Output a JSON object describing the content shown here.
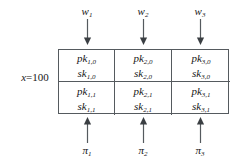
{
  "figure": {
    "type": "diagram",
    "background_color": "#ffffff",
    "line_color": "#555a5e",
    "text_color": "#171717"
  },
  "left_label": {
    "variable": "x",
    "equals": "=",
    "value": "100",
    "full_text": "x = 100"
  },
  "top_inputs": [
    {
      "symbol": "w",
      "subscript": "1",
      "full_text": "w1",
      "arrow": "down-arrow"
    },
    {
      "symbol": "w",
      "subscript": "2",
      "full_text": "w2",
      "arrow": "down-arrow"
    },
    {
      "symbol": "w",
      "subscript": "3",
      "full_text": "w3",
      "arrow": "down-arrow"
    }
  ],
  "bottom_outputs": [
    {
      "symbol": "π",
      "subscript": "1",
      "full_text": "π1",
      "arrow": "up-arrow"
    },
    {
      "symbol": "π",
      "subscript": "2",
      "full_text": "π2",
      "arrow": "up-arrow"
    },
    {
      "symbol": "π",
      "subscript": "3",
      "full_text": "π3",
      "arrow": "up-arrow"
    }
  ],
  "grid": {
    "columns": 3,
    "rows": 2,
    "cells": [
      [
        {
          "pk": "pk",
          "pk_sub": "1,0",
          "sk": "sk",
          "sk_sub": "1,0"
        },
        {
          "pk": "pk",
          "pk_sub": "2,0",
          "sk": "sk",
          "sk_sub": "2,0"
        },
        {
          "pk": "pk",
          "pk_sub": "3,0",
          "sk": "sk",
          "sk_sub": "3,0"
        }
      ],
      [
        {
          "pk": "pk",
          "pk_sub": "1,1",
          "sk": "sk",
          "sk_sub": "1,1"
        },
        {
          "pk": "pk",
          "pk_sub": "2,1",
          "sk": "sk",
          "sk_sub": "2,1"
        },
        {
          "pk": "pk",
          "pk_sub": "3,1",
          "sk": "sk",
          "sk_sub": "3,1"
        }
      ]
    ]
  }
}
